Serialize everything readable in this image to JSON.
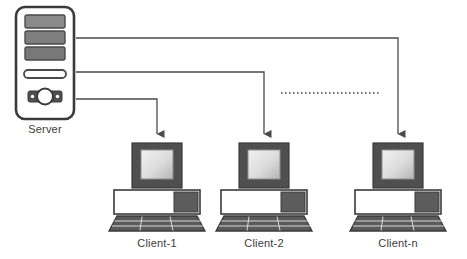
{
  "diagram": {
    "type": "network-topology",
    "background_color": "#ffffff",
    "line_color": "#4a4a4a",
    "dark_fill": "#4f4f4f",
    "mid_fill": "#777777",
    "label_color": "#3b3b3b",
    "outline_color": "#3a3a3a"
  },
  "server": {
    "label": "Server",
    "icon": "server-tower-icon",
    "drive_bays": 3,
    "slot_count": 1,
    "x": 46,
    "y": 62,
    "width": 58,
    "height": 112
  },
  "clients": [
    {
      "label": "Client-1",
      "icon": "desktop-computer-icon",
      "center_x": 157,
      "arrow_from_line": 3
    },
    {
      "label": "Client-2",
      "icon": "desktop-computer-icon",
      "center_x": 264,
      "arrow_from_line": 2
    },
    {
      "label": "Client-n",
      "icon": "desktop-computer-icon",
      "center_x": 398,
      "arrow_from_line": 1
    }
  ],
  "connections": [
    {
      "name": "server-to-client-n",
      "from": "Server",
      "to": "Client-n",
      "style": "solid",
      "arrowhead": "down"
    },
    {
      "name": "server-to-client-2",
      "from": "Server",
      "to": "Client-2",
      "style": "solid",
      "arrowhead": "down"
    },
    {
      "name": "server-to-client-1",
      "from": "Server",
      "to": "Client-1",
      "style": "solid",
      "arrowhead": "down"
    }
  ],
  "ellipsis": {
    "name": "continuation-dotted-line",
    "style": "dotted",
    "meaning": "additional clients omitted",
    "x1": 281,
    "x2": 381,
    "y": 93
  }
}
